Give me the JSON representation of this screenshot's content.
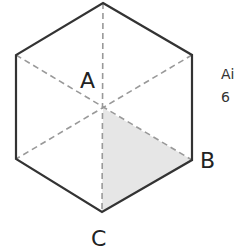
{
  "diagram": {
    "shape": "regular hexagon with dashed diagonals",
    "labels": {
      "center": "A",
      "vertex_right": "B",
      "vertex_bottom": "C"
    },
    "shaded_region": "triangle A-B-C",
    "colors": {
      "stroke": "#333333",
      "dash": "#999999",
      "shade": "#e6e6e6"
    }
  },
  "side_text": {
    "line1": "Ai",
    "line2": "6"
  }
}
